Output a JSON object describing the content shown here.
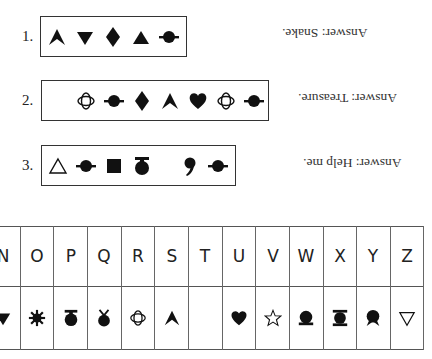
{
  "puzzles": [
    {
      "number": "1.",
      "symbols": [
        "chevron-up",
        "triangle-down-filled",
        "diamond-filled",
        "triangle-up-filled",
        "planet-filled"
      ],
      "answer": "Answer: Snake."
    },
    {
      "number": "2.",
      "symbols": [
        "crescent",
        "orbit-ring",
        "planet-filled",
        "diamond-filled",
        "chevron-up",
        "heart-filled",
        "orbit-ring",
        "planet-filled"
      ],
      "answer": "Answer: Treasure."
    },
    {
      "number": "3.",
      "symbols": [
        "triangle-up-outline",
        "planet-filled",
        "square-filled",
        "pot-with-lid",
        "space",
        "comma",
        "planet-filled"
      ],
      "answer": "Answer: Help me."
    }
  ],
  "key_table": {
    "letters": [
      "N",
      "O",
      "P",
      "Q",
      "R",
      "S",
      "T",
      "U",
      "V",
      "W",
      "X",
      "Y",
      "Z"
    ],
    "symbols": [
      "triangle-down-filled",
      "sunburst",
      "pot-with-lid",
      "bulb-with-horns",
      "orbit-ring",
      "chevron-up",
      "crescent",
      "heart-filled",
      "star-outline",
      "dome-on-base",
      "spool",
      "rosette",
      "triangle-down-outline"
    ]
  }
}
